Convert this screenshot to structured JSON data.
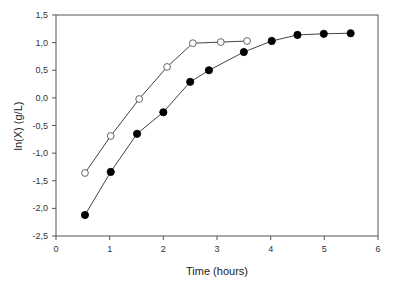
{
  "chart_data": {
    "type": "scatter",
    "title": "",
    "xlabel": "Time (hours)",
    "ylabel": "ln(X) (g/L)",
    "xlim": [
      0,
      6
    ],
    "ylim": [
      -2.5,
      1.5
    ],
    "xticks": [
      0,
      1,
      2,
      3,
      4,
      5,
      6
    ],
    "xtick_labels": [
      "0",
      "1",
      "2",
      "3",
      "4",
      "5",
      "6"
    ],
    "yticks": [
      -2.5,
      -2.0,
      -1.5,
      -1.0,
      -0.5,
      0.0,
      0.5,
      1.0,
      1.5
    ],
    "ytick_labels": [
      "-2,5",
      "-2,0",
      "-1,5",
      "-1,0",
      "-0,5",
      "0,0",
      "0,5",
      "1,0",
      "1,5"
    ],
    "grid": false,
    "legend": null,
    "series": [
      {
        "name": "open circles",
        "marker": "open-circle",
        "color": "#333333",
        "x": [
          0.54,
          1.02,
          1.55,
          2.07,
          2.55,
          3.07,
          3.56
        ],
        "y": [
          -1.36,
          -0.69,
          -0.02,
          0.56,
          0.99,
          1.01,
          1.03
        ]
      },
      {
        "name": "filled circles",
        "marker": "filled-circle",
        "color": "#000000",
        "x": [
          0.54,
          1.02,
          1.51,
          2.0,
          2.5,
          2.85,
          3.5,
          4.02,
          4.5,
          4.99,
          5.49
        ],
        "y": [
          -2.12,
          -1.34,
          -0.65,
          -0.26,
          0.29,
          0.5,
          0.83,
          1.03,
          1.14,
          1.16,
          1.17
        ]
      }
    ]
  }
}
